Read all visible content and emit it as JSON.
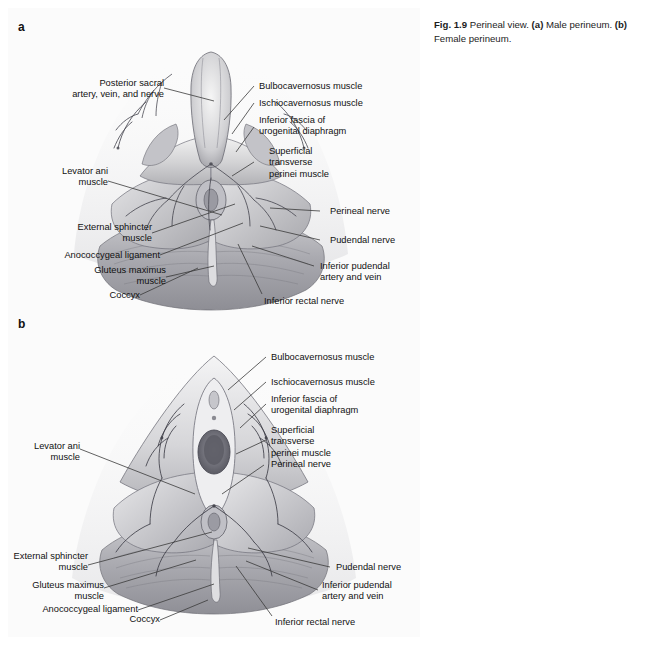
{
  "figure": {
    "plate_bg": "#fbfbfb",
    "page_bg": "#ffffff",
    "ink": "#111111"
  },
  "caption": {
    "fig_number": "Fig. 1.9",
    "title": "Perineal view.",
    "part_a_marker": "(a)",
    "part_a_text": "Male perineum.",
    "part_b_marker": "(b)",
    "part_b_text": "Female perineum."
  },
  "panels": [
    {
      "letter": "a",
      "name": "male-perineum",
      "labels": [
        {
          "id": "posterior-sacral-artery-vein-nerve",
          "text": "Posterior sacral\nartery, vein, and nerve",
          "align": "right"
        },
        {
          "id": "levator-ani-muscle-a",
          "text": "Levator ani\nmuscle",
          "align": "right"
        },
        {
          "id": "external-sphincter-muscle-a",
          "text": "External sphincter\nmuscle",
          "align": "right"
        },
        {
          "id": "anococcygeal-ligament-a",
          "text": "Anococcygeal ligament",
          "align": "right"
        },
        {
          "id": "gluteus-maximus-muscle-a",
          "text": "Gluteus maximus\nmuscle",
          "align": "right"
        },
        {
          "id": "coccyx-a",
          "text": "Coccyx",
          "align": "right"
        },
        {
          "id": "bulbocavernosus-muscle-a",
          "text": "Bulbocavernosus muscle",
          "align": "left"
        },
        {
          "id": "ischiocavernosus-muscle-a",
          "text": "Ischiocavernosus muscle",
          "align": "left"
        },
        {
          "id": "inferior-fascia-urogenital-diaphragm-a",
          "text": "Inferior fascia of\nurogenital diaphragm",
          "align": "left"
        },
        {
          "id": "superficial-transverse-perinei-muscle-a",
          "text": "Superficial\ntransverse\nperinei muscle",
          "align": "left"
        },
        {
          "id": "perineal-nerve-a",
          "text": "Perineal nerve",
          "align": "left"
        },
        {
          "id": "pudendal-nerve-a",
          "text": "Pudendal nerve",
          "align": "left"
        },
        {
          "id": "inferior-pudendal-artery-vein-a",
          "text": "Inferior pudendal\nartery and vein",
          "align": "left"
        },
        {
          "id": "inferior-rectal-nerve-a",
          "text": "Inferior rectal nerve",
          "align": "left"
        }
      ]
    },
    {
      "letter": "b",
      "name": "female-perineum",
      "labels": [
        {
          "id": "levator-ani-muscle-b",
          "text": "Levator ani\nmuscle",
          "align": "right"
        },
        {
          "id": "external-sphincter-muscle-b",
          "text": "External sphincter\nmuscle",
          "align": "right"
        },
        {
          "id": "gluteus-maximus-muscle-b",
          "text": "Gluteus maximus\nmuscle",
          "align": "right"
        },
        {
          "id": "anococcygeal-ligament-b",
          "text": "Anococcygeal ligament",
          "align": "right"
        },
        {
          "id": "coccyx-b",
          "text": "Coccyx",
          "align": "right"
        },
        {
          "id": "bulbocavernosus-muscle-b",
          "text": "Bulbocavernosus muscle",
          "align": "left"
        },
        {
          "id": "ischiocavernosus-muscle-b",
          "text": "Ischiocavernosus muscle",
          "align": "left"
        },
        {
          "id": "inferior-fascia-urogenital-diaphragm-b",
          "text": "Inferior fascia of\nurogenital diaphragm",
          "align": "left"
        },
        {
          "id": "superficial-transverse-perinei-muscle-b",
          "text": "Superficial\ntransverse\nperinei muscle",
          "align": "left"
        },
        {
          "id": "perineal-nerve-b",
          "text": "Perineal nerve",
          "align": "left"
        },
        {
          "id": "pudendal-nerve-b",
          "text": "Pudendal nerve",
          "align": "left"
        },
        {
          "id": "inferior-pudendal-artery-vein-b",
          "text": "Inferior pudendal\nartery and vein",
          "align": "left"
        },
        {
          "id": "inferior-rectal-nerve-b",
          "text": "Inferior rectal nerve",
          "align": "left"
        }
      ]
    }
  ]
}
